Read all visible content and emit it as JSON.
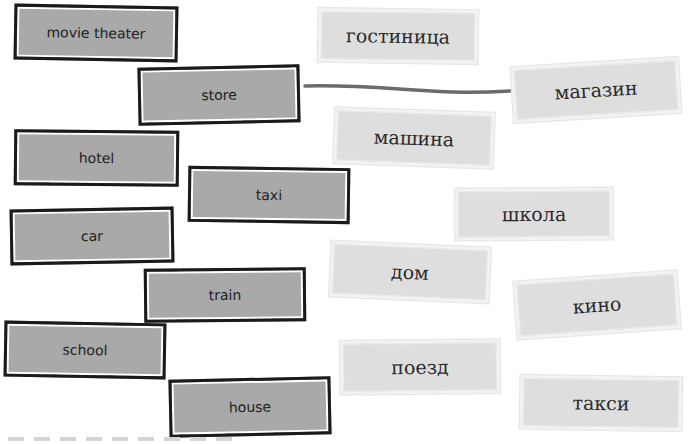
{
  "exercise": {
    "type": "matching",
    "english_cards": [
      {
        "id": "movie-theater",
        "label": "movie theater"
      },
      {
        "id": "store",
        "label": "store"
      },
      {
        "id": "hotel",
        "label": "hotel"
      },
      {
        "id": "taxi",
        "label": "taxi"
      },
      {
        "id": "car",
        "label": "car"
      },
      {
        "id": "train",
        "label": "train"
      },
      {
        "id": "school",
        "label": "school"
      },
      {
        "id": "house",
        "label": "house"
      }
    ],
    "russian_cards": [
      {
        "id": "gostinitsa",
        "label": "гостиница"
      },
      {
        "id": "magazin",
        "label": "магазин"
      },
      {
        "id": "mashina",
        "label": "машина"
      },
      {
        "id": "shkola",
        "label": "школа"
      },
      {
        "id": "dom",
        "label": "дом"
      },
      {
        "id": "kino",
        "label": "кино"
      },
      {
        "id": "poezd",
        "label": "поезд"
      },
      {
        "id": "taksi",
        "label": "такси"
      }
    ],
    "connections": [
      {
        "from": "store",
        "to": "магазин"
      }
    ]
  },
  "colors": {
    "english_card_fill": "#a9a9a9",
    "english_card_border": "#1a1a1a",
    "russian_card_fill": "#dedede",
    "russian_card_border": "#f2f2f2",
    "connection_line": "#6b6b6b"
  }
}
